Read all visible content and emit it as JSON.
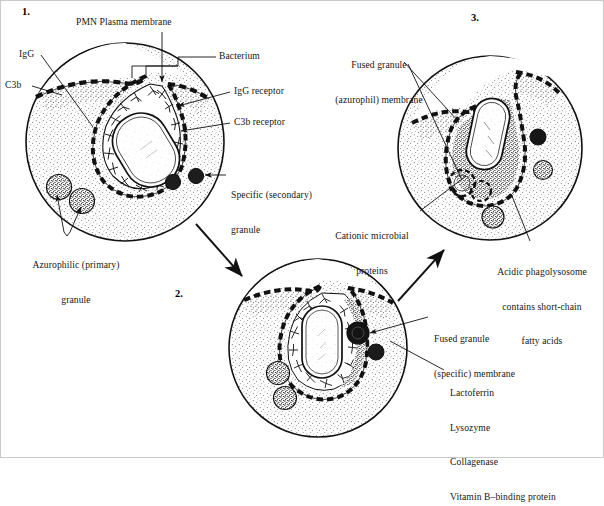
{
  "figure": {
    "title_present": false,
    "background": "#ffffff",
    "ink": "#111111",
    "cytoplasm_stipple": "#9a9a9a",
    "width": 604,
    "height": 458
  },
  "steps": [
    {
      "id": "step-1",
      "number": "1.",
      "x": 22,
      "y": 8
    },
    {
      "id": "step-2",
      "number": "2.",
      "x": 175,
      "y": 291
    },
    {
      "id": "step-3",
      "number": "3.",
      "x": 471,
      "y": 14
    }
  ],
  "cells": [
    {
      "id": "cell-1",
      "name": "pmn-attachment-stage",
      "cx": 125,
      "cy": 142,
      "r": 100,
      "step": "1."
    },
    {
      "id": "cell-2",
      "name": "pmn-specific-granule-fusion-stage",
      "cx": 318,
      "cy": 348,
      "r": 90,
      "step": "2."
    },
    {
      "id": "cell-3",
      "name": "pmn-phagolysosome-stage",
      "cx": 490,
      "cy": 148,
      "r": 93,
      "step": "3."
    }
  ],
  "labels": [
    {
      "id": "pmn-plasma-membrane",
      "name": "label-pmn-plasma-membrane",
      "text": "PMN Plasma membrane",
      "lines": [
        "PMN Plasma membrane"
      ],
      "x": 76,
      "y": 18,
      "align": "left",
      "leader": {
        "from": [
          162,
          31
        ],
        "to": [
          162,
          83
        ],
        "arrow": true
      }
    },
    {
      "id": "igg",
      "name": "label-igg",
      "text": "IgG",
      "lines": [
        "IgG"
      ],
      "x": 19,
      "y": 50,
      "align": "left",
      "leader": {
        "from": [
          41,
          55
        ],
        "to": [
          92,
          125
        ],
        "arrow": false
      }
    },
    {
      "id": "c3b",
      "name": "label-c3b",
      "text": "C3b",
      "lines": [
        "C3b"
      ],
      "x": 6,
      "y": 81,
      "align": "left",
      "leader": {
        "from": [
          33,
          86
        ],
        "to": [
          63,
          95
        ],
        "arrow": false
      }
    },
    {
      "id": "bacterium",
      "name": "label-bacterium",
      "text": "Bacterium",
      "lines": [
        "Bacterium"
      ],
      "x": 218,
      "y": 52,
      "align": "left",
      "leader": {
        "from": [
          216,
          57
        ],
        "to": [
          158,
          74
        ],
        "arrow": false
      }
    },
    {
      "id": "igg-receptor",
      "name": "label-igg-receptor",
      "text": "IgG receptor",
      "lines": [
        "IgG receptor"
      ],
      "x": 233,
      "y": 87,
      "align": "left",
      "leader": {
        "from": [
          231,
          92
        ],
        "to": [
          176,
          105
        ],
        "arrow": true
      }
    },
    {
      "id": "c3b-receptor",
      "name": "label-c3b-receptor",
      "text": "C3b receptor",
      "lines": [
        "C3b receptor"
      ],
      "x": 233,
      "y": 118,
      "align": "left",
      "leader": {
        "from": [
          231,
          123
        ],
        "to": [
          178,
          130
        ],
        "arrow": true
      }
    },
    {
      "id": "specific-granule",
      "name": "label-specific-secondary-granule",
      "text": "Specific (secondary) granule",
      "lines": [
        "Specific (secondary)",
        "granule"
      ],
      "x": 228,
      "y": 168,
      "align": "left",
      "leader": {
        "from": [
          226,
          175
        ],
        "to": [
          203,
          175
        ],
        "arrow": true
      }
    },
    {
      "id": "azurophilic-granule",
      "name": "label-azurophilic-primary-granule",
      "text": "Azurophilic (primary) granule",
      "lines": [
        "Azurophilic (primary)",
        "granule"
      ],
      "x": 18,
      "y": 236,
      "align": "left",
      "leader": {
        "from": [
          66,
          234
        ],
        "to": [
          57,
          191
        ],
        "arrow": true
      },
      "leader2": {
        "from": [
          70,
          234
        ],
        "to": [
          80,
          203
        ],
        "arrow": true
      }
    },
    {
      "id": "fused-granule-azurophil",
      "name": "label-fused-granule-azurophil-membrane",
      "text": "Fused granule (azurophil) membrane",
      "lines": [
        "Fused granule",
        "(azurophil) membrane"
      ],
      "x": 330,
      "y": 36,
      "align": "left",
      "leader": {
        "from": [
          404,
          62
        ],
        "to": [
          455,
          119
        ],
        "arrow": false
      }
    },
    {
      "id": "cationic-microbial-proteins",
      "name": "label-cationic-microbial-proteins",
      "text": "Cationic microbial proteins",
      "lines": [
        "Cationic microbial",
        "proteins"
      ],
      "x": 326,
      "y": 207,
      "align": "left",
      "leader": {
        "from": [
          420,
          211
        ],
        "to": [
          462,
          178
        ],
        "arrow": false
      }
    },
    {
      "id": "acidic-phagolysosome",
      "name": "label-acidic-phagolysosome",
      "text": "Acidic phagolysosome contains short-chain fatty acids",
      "lines": [
        "Acidic phagolysosome",
        "contains short-chain",
        "fatty acids"
      ],
      "x": 488,
      "y": 244,
      "align": "left",
      "leader": {
        "from": [
          532,
          244
        ],
        "to": [
          512,
          196
        ],
        "arrow": false
      }
    },
    {
      "id": "fused-granule-specific",
      "name": "label-fused-granule-specific-membrane",
      "text": "Fused granule (specific) membrane",
      "lines": [
        "Fused granule",
        "(specific) membrane"
      ],
      "x": 431,
      "y": 311,
      "align": "left",
      "leader": {
        "from": [
          429,
          317
        ],
        "to": [
          367,
          333
        ],
        "arrow": true
      }
    },
    {
      "id": "granule-contents",
      "name": "label-specific-granule-contents",
      "text": "Lactoferrin Lysozyme Collagenase Vitamin B–binding protein",
      "lines": [
        "Lactoferrin",
        "Lysozyme",
        "Collagenase",
        "Vitamin B–binding protein"
      ],
      "x": 448,
      "y": 365,
      "align": "left",
      "leader": {
        "from": [
          444,
          370
        ],
        "to": [
          388,
          340
        ],
        "arrow": false
      }
    }
  ],
  "flow_arrows": [
    {
      "id": "arrow-1-to-2",
      "name": "arrow-step1-to-step2",
      "from": [
        196,
        224
      ],
      "to": [
        244,
        277
      ]
    },
    {
      "id": "arrow-2-to-3",
      "name": "arrow-step2-to-step3",
      "from": [
        398,
        300
      ],
      "to": [
        446,
        248
      ]
    }
  ],
  "legend_keys": {
    "membrane_style": "dashed black-and-white bilayer",
    "bacterium_shape": "rod (capsule)",
    "granule_fill": "dark stipple"
  }
}
